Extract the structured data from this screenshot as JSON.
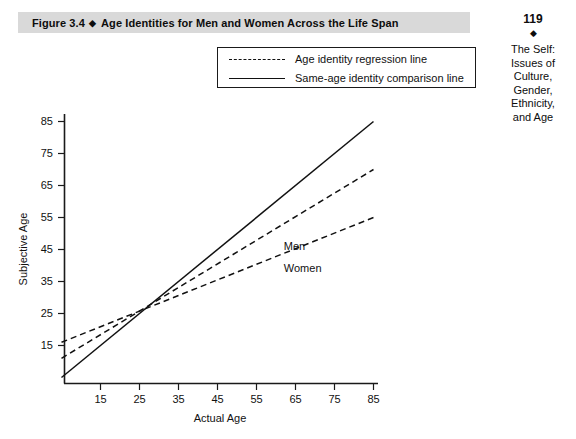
{
  "figure": {
    "label": "Figure 3.4",
    "separator": "◆",
    "title": "Age Identities for Men and Women Across the Life Span"
  },
  "sidebar": {
    "page_number": "119",
    "diamond": "◆",
    "caption_lines": [
      "The Self:",
      "Issues of",
      "Culture,",
      "Gender,",
      "Ethnicity,",
      "and Age"
    ]
  },
  "legend": {
    "position": "top-center-inside",
    "entries": [
      {
        "label": "Age identity regression line",
        "style": "dashed"
      },
      {
        "label": "Same-age identity comparison line",
        "style": "solid"
      }
    ]
  },
  "chart_data": {
    "type": "line",
    "title": "Age Identities for Men and Women Across the Life Span",
    "xlabel": "Actual Age",
    "ylabel": "Subjective Age",
    "xlim": [
      5,
      90
    ],
    "ylim": [
      5,
      90
    ],
    "xticks": [
      "15",
      "25",
      "35",
      "45",
      "55",
      "65",
      "75",
      "85"
    ],
    "yticks": [
      "15",
      "25",
      "35",
      "45",
      "55",
      "65",
      "75",
      "85"
    ],
    "grid": false,
    "series": [
      {
        "name": "Same-age identity comparison line",
        "style": "solid",
        "annotation": "",
        "x": [
          5,
          85
        ],
        "y": [
          5,
          85
        ]
      },
      {
        "name": "Men",
        "style": "dashed",
        "annotation": "Men",
        "x": [
          5,
          85
        ],
        "y": [
          11,
          70
        ]
      },
      {
        "name": "Women",
        "style": "dashed",
        "annotation": "Women",
        "x": [
          5,
          85
        ],
        "y": [
          16,
          55
        ]
      }
    ],
    "annotations": [
      {
        "text": "Men",
        "x": 62,
        "y": 45
      },
      {
        "text": "Women",
        "x": 62,
        "y": 38
      }
    ]
  },
  "colors": {
    "title_bar": "#d9d9d9",
    "ink": "#111111",
    "background": "#ffffff"
  }
}
